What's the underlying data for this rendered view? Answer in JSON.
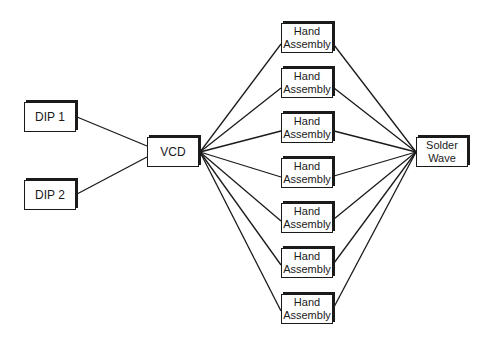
{
  "diagram": {
    "type": "flow",
    "nodes": [
      {
        "id": "dip1",
        "label_lines": [
          "DIP 1"
        ],
        "x": 24,
        "y": 102,
        "w": 52,
        "h": 30
      },
      {
        "id": "dip2",
        "label_lines": [
          "DIP 2"
        ],
        "x": 24,
        "y": 180,
        "w": 52,
        "h": 30
      },
      {
        "id": "vcd",
        "label_lines": [
          "VCD"
        ],
        "x": 147,
        "y": 137,
        "w": 52,
        "h": 30
      },
      {
        "id": "ha1",
        "label_lines": [
          "Hand",
          "Assembly"
        ],
        "x": 281,
        "y": 23,
        "w": 52,
        "h": 30
      },
      {
        "id": "ha2",
        "label_lines": [
          "Hand",
          "Assembly"
        ],
        "x": 281,
        "y": 68,
        "w": 52,
        "h": 30
      },
      {
        "id": "ha3",
        "label_lines": [
          "Hand",
          "Assembly"
        ],
        "x": 281,
        "y": 113,
        "w": 52,
        "h": 30
      },
      {
        "id": "ha4",
        "label_lines": [
          "Hand",
          "Assembly"
        ],
        "x": 281,
        "y": 158,
        "w": 52,
        "h": 30
      },
      {
        "id": "ha5",
        "label_lines": [
          "Hand",
          "Assembly"
        ],
        "x": 281,
        "y": 203,
        "w": 52,
        "h": 30
      },
      {
        "id": "ha6",
        "label_lines": [
          "Hand",
          "Assembly"
        ],
        "x": 281,
        "y": 248,
        "w": 52,
        "h": 30
      },
      {
        "id": "ha7",
        "label_lines": [
          "Hand",
          "Assembly"
        ],
        "x": 281,
        "y": 294,
        "w": 52,
        "h": 30
      },
      {
        "id": "solder",
        "label_lines": [
          "Solder",
          "Wave"
        ],
        "x": 416,
        "y": 137,
        "w": 52,
        "h": 30
      }
    ],
    "edges": [
      {
        "from": "dip1",
        "to": "vcd",
        "x1": 77,
        "y1": 117,
        "x2": 147,
        "y2": 146
      },
      {
        "from": "dip2",
        "to": "vcd",
        "x1": 77,
        "y1": 194,
        "x2": 147,
        "y2": 157
      },
      {
        "from": "vcd",
        "to": "ha1",
        "x1": 200,
        "y1": 152,
        "x2": 281,
        "y2": 44
      },
      {
        "from": "vcd",
        "to": "ha2",
        "x1": 200,
        "y1": 152,
        "x2": 281,
        "y2": 88
      },
      {
        "from": "vcd",
        "to": "ha3",
        "x1": 200,
        "y1": 152,
        "x2": 281,
        "y2": 131
      },
      {
        "from": "vcd",
        "to": "ha4",
        "x1": 200,
        "y1": 152,
        "x2": 281,
        "y2": 177
      },
      {
        "from": "vcd",
        "to": "ha5",
        "x1": 200,
        "y1": 152,
        "x2": 281,
        "y2": 221
      },
      {
        "from": "vcd",
        "to": "ha6",
        "x1": 200,
        "y1": 152,
        "x2": 281,
        "y2": 265
      },
      {
        "from": "vcd",
        "to": "ha7",
        "x1": 200,
        "y1": 152,
        "x2": 281,
        "y2": 311
      },
      {
        "from": "ha1",
        "to": "solder",
        "x1": 334,
        "y1": 45,
        "x2": 416,
        "y2": 152
      },
      {
        "from": "ha2",
        "to": "solder",
        "x1": 334,
        "y1": 88,
        "x2": 416,
        "y2": 152
      },
      {
        "from": "ha3",
        "to": "solder",
        "x1": 334,
        "y1": 131,
        "x2": 416,
        "y2": 152
      },
      {
        "from": "ha4",
        "to": "solder",
        "x1": 334,
        "y1": 176,
        "x2": 416,
        "y2": 152
      },
      {
        "from": "ha5",
        "to": "solder",
        "x1": 334,
        "y1": 219,
        "x2": 416,
        "y2": 152
      },
      {
        "from": "ha6",
        "to": "solder",
        "x1": 334,
        "y1": 263,
        "x2": 416,
        "y2": 152
      },
      {
        "from": "ha7",
        "to": "solder",
        "x1": 334,
        "y1": 307,
        "x2": 416,
        "y2": 152
      }
    ],
    "colors": {
      "line": "#1a1a1a",
      "box_border": "#1a1a1a",
      "box_fill": "#ffffff",
      "background": "#ffffff"
    }
  }
}
